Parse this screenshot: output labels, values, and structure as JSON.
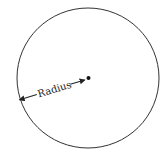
{
  "diagram": {
    "type": "circle-radius",
    "label": "Radius",
    "stroke_color": "#222222",
    "background": "#ffffff"
  }
}
